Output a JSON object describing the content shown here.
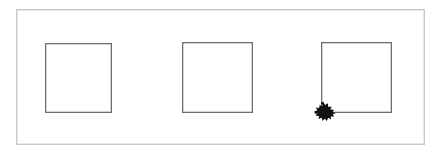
{
  "figure": {
    "title": "",
    "background_color": "#ffffff",
    "width": 441,
    "height": 154
  },
  "frame": {
    "name": "outer-border-frame",
    "stroke_color": "#c9c9c9",
    "stroke_width": 1.4,
    "fill": "#ffffff",
    "x": 16,
    "y": 9,
    "width": 409,
    "height": 136
  },
  "shapes": [
    {
      "id": "square-1",
      "label": "",
      "stroke_color": "#6e6e6e",
      "stroke_width": 1.3,
      "fill": "#ffffff",
      "x": 45,
      "y": 43,
      "width": 67,
      "height": 70
    },
    {
      "id": "square-2",
      "label": "",
      "stroke_color": "#6e6e6e",
      "stroke_width": 1.3,
      "fill": "#ffffff",
      "x": 182,
      "y": 42,
      "width": 71,
      "height": 71
    },
    {
      "id": "square-3",
      "label": "",
      "stroke_color": "#6e6e6e",
      "stroke_width": 1.3,
      "fill": "#ffffff",
      "x": 321,
      "y": 42,
      "width": 71,
      "height": 71
    }
  ],
  "marker": {
    "id": "ink-blot-marker",
    "description": "black ink blot",
    "color": "#111111",
    "center_x": 323,
    "center_y": 111,
    "radius": 8
  }
}
